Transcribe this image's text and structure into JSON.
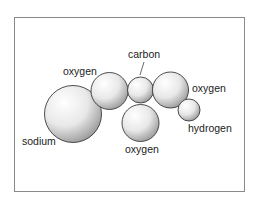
{
  "diagram": {
    "type": "molecule-space-filling",
    "atoms": [
      {
        "id": "sodium",
        "label": "sodium",
        "cx": 73,
        "cy": 114,
        "r": 28.5
      },
      {
        "id": "oxygen-left",
        "label": "oxygen",
        "cx": 109.5,
        "cy": 91,
        "r": 18.5
      },
      {
        "id": "carbon",
        "label": "carbon",
        "cx": 140.5,
        "cy": 90,
        "r": 13
      },
      {
        "id": "oxygen-right",
        "label": "oxygen",
        "cx": 170.5,
        "cy": 90,
        "r": 18
      },
      {
        "id": "oxygen-bottom",
        "label": "oxygen",
        "cx": 140.5,
        "cy": 123,
        "r": 18.5
      },
      {
        "id": "hydrogen",
        "label": "hydrogen",
        "cx": 189,
        "cy": 110,
        "r": 11
      }
    ],
    "labels": {
      "carbon": "carbon",
      "oxygen_left": "oxygen",
      "oxygen_right": "oxygen",
      "oxygen_bottom": "oxygen",
      "hydrogen": "hydrogen",
      "sodium": "sodium"
    },
    "colors": {
      "frame_border": "#8a8a8a",
      "atom_outline": "#3a3a3a",
      "atom_highlight": "#ffffff",
      "atom_shadow": "#9a9a9a",
      "text": "#222222"
    }
  }
}
